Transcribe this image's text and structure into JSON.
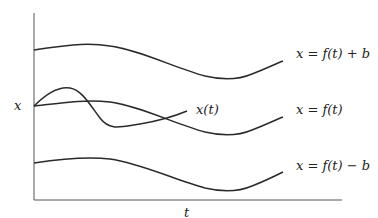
{
  "diagram": {
    "axes": {
      "y_label": "x",
      "x_label": "t"
    },
    "curves": [
      {
        "id": "upper",
        "label": "x = f(t) + b"
      },
      {
        "id": "middle",
        "label": "x = f(t)"
      },
      {
        "id": "lower",
        "label": "x = f(t) − b"
      },
      {
        "id": "trajectory",
        "label": "x(t)"
      }
    ],
    "colors": {
      "stroke": "#2a2a2a",
      "axis": "#555555",
      "background": "#ffffff"
    }
  }
}
